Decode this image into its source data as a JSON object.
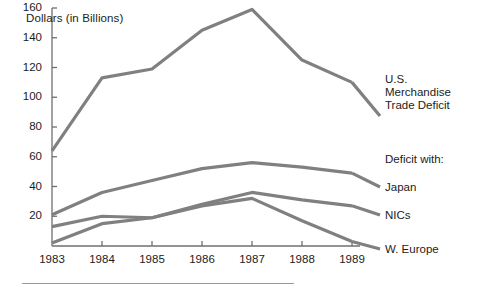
{
  "chart_data": {
    "type": "line",
    "title": "",
    "ylabel": "Dollars (in Billions)",
    "xlabel": "",
    "categories": [
      "1983",
      "1984",
      "1985",
      "1986",
      "1987",
      "1988",
      "1989"
    ],
    "x": [
      1983,
      1984,
      1985,
      1986,
      1987,
      1988,
      1989
    ],
    "ylim": [
      0,
      160
    ],
    "yticks": [
      20,
      40,
      60,
      80,
      100,
      120,
      140,
      160
    ],
    "ytick_labels": [
      "20",
      "40",
      "60",
      "80",
      "100",
      "120",
      "140",
      "160"
    ],
    "grid": false,
    "legend_position": "right-inline",
    "line_color": "#808080",
    "series": [
      {
        "name": "U.S. Merchandise Trade Deficit",
        "label": "U.S.\nMerchandise\nTrade Deficit",
        "values": [
          64,
          113,
          119,
          145,
          159,
          125,
          110
        ]
      },
      {
        "name": "Japan",
        "label": "Japan",
        "values": [
          21,
          36,
          44,
          52,
          56,
          53,
          49
        ]
      },
      {
        "name": "NICs",
        "label": "NICs",
        "values": [
          13,
          20,
          19,
          28,
          36,
          31,
          27
        ]
      },
      {
        "name": "W. Europe",
        "label": "W. Europe",
        "values": [
          2,
          15,
          19,
          27,
          32,
          17,
          3
        ]
      }
    ],
    "annotations": [
      {
        "text": "Deficit with:",
        "note": "group heading for Japan, NICs, W. Europe series labels"
      }
    ]
  },
  "labels": {
    "axis_title": "Dollars (in Billions)",
    "deficit_with": "Deficit with:",
    "series_us": "U.S.\nMerchandise\nTrade Deficit",
    "series_japan": "Japan",
    "series_nics": "NICs",
    "series_weurope": "W. Europe"
  },
  "colors": {
    "line": "#808080",
    "axis": "#6f6f6f",
    "text": "#1c1c1c",
    "rule": "#9a9a9a",
    "background": "#ffffff"
  }
}
